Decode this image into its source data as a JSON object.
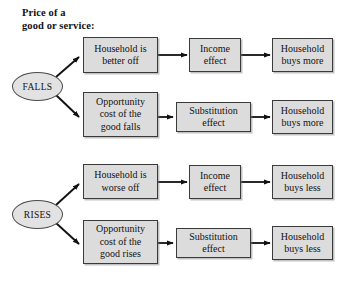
{
  "diagram": {
    "title": "Price of a\ngood or service:",
    "type": "flowchart",
    "colors": {
      "box_fill": "#dcdcdc",
      "box_border": "#3a3a3a",
      "ellipse_fill": "#e2e2e2",
      "ellipse_border": "#4a4a4a",
      "arrow": "#111111",
      "background": "#ffffff"
    },
    "sources": [
      {
        "id": "falls",
        "label": "FALLS"
      },
      {
        "id": "rises",
        "label": "RISES"
      }
    ],
    "rows": [
      {
        "id": "row-falls-income",
        "source": "FALLS",
        "stage1": "Household is\nbetter off",
        "stage2": "Income\neffect",
        "stage3": "Household\nbuys more"
      },
      {
        "id": "row-falls-substitution",
        "source": "FALLS",
        "stage1": "Opportunity\ncost of the\ngood falls",
        "stage2": "Substitution\neffect",
        "stage3": "Household\nbuys more"
      },
      {
        "id": "row-rises-income",
        "source": "RISES",
        "stage1": "Household is\nworse off",
        "stage2": "Income\neffect",
        "stage3": "Household\nbuys less"
      },
      {
        "id": "row-rises-substitution",
        "source": "RISES",
        "stage1": "Opportunity\ncost of the\ngood rises",
        "stage2": "Substitution\neffect",
        "stage3": "Household\nbuys less"
      }
    ]
  }
}
